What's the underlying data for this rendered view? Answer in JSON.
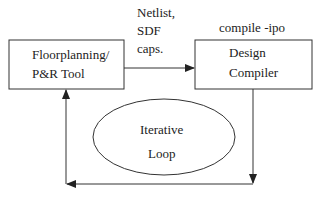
{
  "nodes": {
    "floorplanning": {
      "line1": "Floorplanning/",
      "line2": "P&R Tool"
    },
    "design_compiler": {
      "line1": "Design",
      "line2": "Compiler"
    },
    "iterative_loop": {
      "line1": "Iterative",
      "line2": "Loop"
    }
  },
  "labels": {
    "netlist": {
      "line1": "Netlist,",
      "line2": "SDF",
      "line3": "caps."
    },
    "compile": "compile -ipo"
  },
  "colors": {
    "stroke": "#222222",
    "background": "#ffffff"
  }
}
